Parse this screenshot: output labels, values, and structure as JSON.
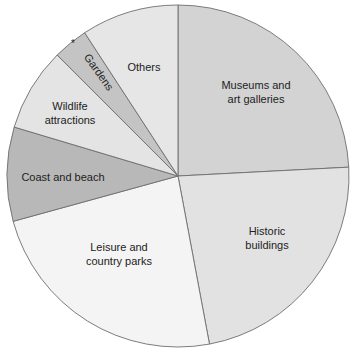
{
  "chart_data": {
    "type": "pie",
    "title": "",
    "start_angle_deg": 0,
    "direction": "clockwise",
    "units": "percent (estimated from slice angles)",
    "slices": [
      {
        "label": "Museums and art galleries",
        "label_lines": [
          "Museums and",
          "art galleries"
        ],
        "value": 24.2,
        "color": "#d3d3d3",
        "label_pos": [
          256,
          92
        ],
        "rotate": 0
      },
      {
        "label": "Historic buildings",
        "label_lines": [
          "Historic",
          "buildings"
        ],
        "value": 22.9,
        "color": "#e2e2e2",
        "label_pos": [
          267,
          238
        ],
        "rotate": 0
      },
      {
        "label": "Leisure and country parks",
        "label_lines": [
          "Leisure and",
          "country parks"
        ],
        "value": 23.7,
        "color": "#f4f4f4",
        "label_pos": [
          119,
          254
        ],
        "rotate": 0
      },
      {
        "label": "Coast and beach",
        "label_lines": [
          "Coast and beach"
        ],
        "value": 8.9,
        "color": "#b8b8b8",
        "label_pos": [
          63,
          177
        ],
        "rotate": 0
      },
      {
        "label": "Wildlife attractions",
        "label_lines": [
          "Wildlife",
          "attractions"
        ],
        "value": 7.9,
        "color": "#e4e4e4",
        "label_pos": [
          70,
          113
        ],
        "rotate": 0
      },
      {
        "label": "Gardens",
        "label_lines": [
          "Gardens"
        ],
        "value": 3.3,
        "color": "#c4c4c4",
        "label_pos": [
          99,
          72
        ],
        "rotate": 55
      },
      {
        "label": "Others",
        "label_lines": [
          "Others"
        ],
        "value": 9.2,
        "color": "#e6e6e6",
        "label_pos": [
          144,
          67
        ],
        "rotate": 0
      }
    ],
    "annotations": [
      {
        "text": "*",
        "pos": [
          73,
          47
        ],
        "note": "asterisk marker next to Gardens slice"
      }
    ],
    "legend": "none (labels inside slices)",
    "center": [
      178,
      176
    ],
    "radius": 171
  }
}
